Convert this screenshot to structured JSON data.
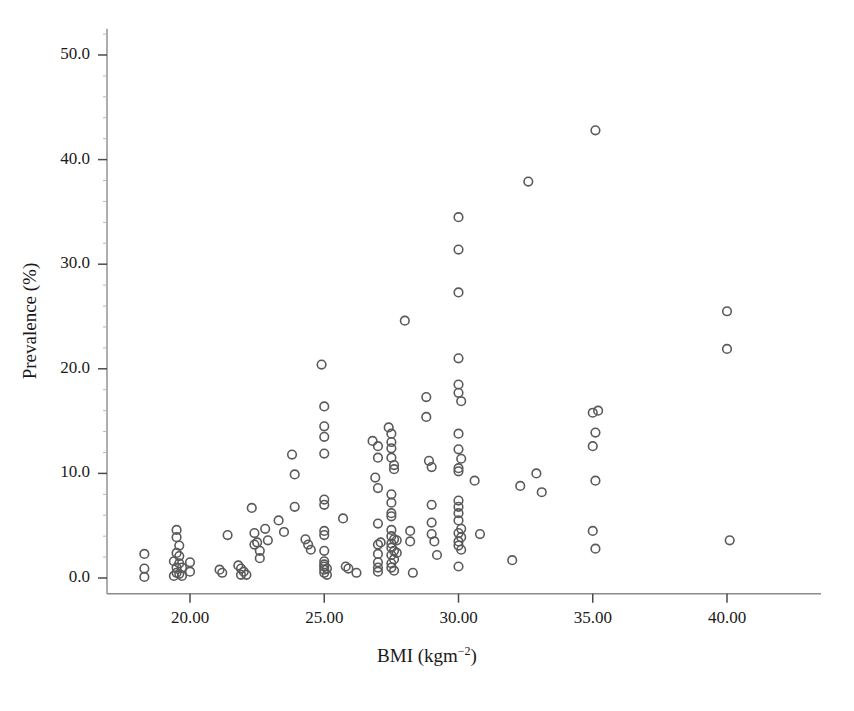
{
  "chart_data": {
    "type": "scatter",
    "title": "",
    "xlabel": "BMI (kgm-2)",
    "xlabel_base": "BMI (kgm",
    "xlabel_sup": "−2",
    "xlabel_tail": ")",
    "ylabel": "Prevalence (%)",
    "xlim": [
      17.2,
      43.5
    ],
    "ylim": [
      -1.5,
      52.5
    ],
    "xticks": [
      20.0,
      25.0,
      30.0,
      35.0,
      40.0
    ],
    "xtick_labels": [
      "20.00",
      "25.00",
      "30.00",
      "35.00",
      "40.00"
    ],
    "yticks": [
      0.0,
      10.0,
      20.0,
      30.0,
      40.0,
      50.0
    ],
    "ytick_labels": [
      "0.0",
      "10.0",
      "20.0",
      "30.0",
      "40.0",
      "50.0"
    ],
    "grid": false,
    "legend": null,
    "marker": "open-circle",
    "marker_color": "#5a5a5a",
    "marker_fill": "none",
    "marker_radius": 4.3,
    "axis_color": "#8a8a8a",
    "points": [
      [
        18.3,
        2.3
      ],
      [
        18.3,
        0.9
      ],
      [
        18.3,
        0.1
      ],
      [
        19.5,
        4.6
      ],
      [
        19.5,
        3.9
      ],
      [
        19.6,
        3.1
      ],
      [
        19.5,
        2.4
      ],
      [
        19.6,
        2.1
      ],
      [
        19.4,
        1.6
      ],
      [
        19.6,
        1.4
      ],
      [
        19.5,
        1.0
      ],
      [
        19.7,
        1.0
      ],
      [
        19.5,
        0.5
      ],
      [
        19.6,
        0.4
      ],
      [
        19.4,
        0.2
      ],
      [
        19.7,
        0.2
      ],
      [
        20.0,
        1.5
      ],
      [
        20.0,
        0.6
      ],
      [
        21.1,
        0.8
      ],
      [
        21.2,
        0.5
      ],
      [
        21.4,
        4.1
      ],
      [
        21.8,
        1.2
      ],
      [
        21.9,
        0.9
      ],
      [
        22.0,
        0.6
      ],
      [
        21.9,
        0.3
      ],
      [
        22.1,
        0.3
      ],
      [
        22.3,
        6.7
      ],
      [
        22.4,
        4.3
      ],
      [
        22.4,
        3.2
      ],
      [
        22.5,
        3.4
      ],
      [
        22.6,
        2.6
      ],
      [
        22.6,
        1.9
      ],
      [
        22.8,
        4.7
      ],
      [
        22.9,
        3.6
      ],
      [
        23.3,
        5.5
      ],
      [
        23.5,
        4.4
      ],
      [
        23.8,
        11.8
      ],
      [
        23.9,
        9.9
      ],
      [
        23.9,
        6.8
      ],
      [
        24.3,
        3.7
      ],
      [
        24.4,
        3.2
      ],
      [
        24.5,
        2.7
      ],
      [
        24.9,
        20.4
      ],
      [
        25.0,
        16.4
      ],
      [
        25.0,
        14.5
      ],
      [
        25.0,
        13.5
      ],
      [
        25.0,
        11.9
      ],
      [
        25.0,
        7.5
      ],
      [
        25.0,
        7.0
      ],
      [
        25.0,
        4.5
      ],
      [
        25.0,
        4.1
      ],
      [
        25.0,
        2.6
      ],
      [
        25.0,
        1.6
      ],
      [
        25.0,
        1.3
      ],
      [
        25.0,
        1.1
      ],
      [
        25.0,
        0.8
      ],
      [
        25.0,
        0.5
      ],
      [
        25.1,
        0.9
      ],
      [
        25.1,
        0.3
      ],
      [
        25.7,
        5.7
      ],
      [
        25.8,
        1.1
      ],
      [
        25.9,
        0.9
      ],
      [
        26.2,
        0.5
      ],
      [
        26.8,
        13.1
      ],
      [
        27.0,
        12.6
      ],
      [
        27.0,
        11.5
      ],
      [
        26.9,
        9.6
      ],
      [
        27.0,
        8.6
      ],
      [
        27.0,
        5.2
      ],
      [
        27.1,
        3.4
      ],
      [
        27.0,
        3.2
      ],
      [
        27.0,
        2.3
      ],
      [
        27.0,
        1.5
      ],
      [
        27.0,
        1.0
      ],
      [
        27.0,
        0.6
      ],
      [
        27.4,
        14.4
      ],
      [
        27.5,
        13.8
      ],
      [
        27.5,
        13.0
      ],
      [
        27.5,
        12.4
      ],
      [
        27.5,
        11.5
      ],
      [
        27.6,
        10.8
      ],
      [
        27.6,
        10.4
      ],
      [
        27.5,
        8.0
      ],
      [
        27.5,
        7.2
      ],
      [
        27.5,
        6.2
      ],
      [
        27.5,
        5.9
      ],
      [
        27.5,
        4.6
      ],
      [
        27.5,
        4.0
      ],
      [
        27.6,
        3.7
      ],
      [
        27.5,
        3.3
      ],
      [
        27.5,
        2.9
      ],
      [
        27.6,
        2.6
      ],
      [
        27.5,
        2.2
      ],
      [
        27.6,
        1.8
      ],
      [
        27.5,
        1.4
      ],
      [
        27.5,
        1.0
      ],
      [
        27.6,
        0.7
      ],
      [
        27.7,
        3.6
      ],
      [
        27.7,
        2.4
      ],
      [
        28.0,
        24.6
      ],
      [
        28.2,
        4.5
      ],
      [
        28.2,
        3.5
      ],
      [
        28.3,
        0.5
      ],
      [
        28.8,
        17.3
      ],
      [
        28.8,
        15.4
      ],
      [
        28.9,
        11.2
      ],
      [
        29.0,
        10.6
      ],
      [
        29.0,
        7.0
      ],
      [
        29.0,
        5.3
      ],
      [
        29.0,
        4.2
      ],
      [
        29.1,
        3.5
      ],
      [
        29.2,
        2.2
      ],
      [
        30.0,
        34.5
      ],
      [
        30.0,
        31.4
      ],
      [
        30.0,
        27.3
      ],
      [
        30.0,
        21.0
      ],
      [
        30.0,
        18.5
      ],
      [
        30.0,
        17.7
      ],
      [
        30.1,
        16.9
      ],
      [
        30.0,
        13.8
      ],
      [
        30.0,
        12.3
      ],
      [
        30.1,
        11.4
      ],
      [
        30.0,
        10.5
      ],
      [
        30.0,
        10.2
      ],
      [
        30.0,
        7.4
      ],
      [
        30.0,
        6.8
      ],
      [
        30.0,
        6.2
      ],
      [
        30.0,
        5.5
      ],
      [
        30.1,
        4.7
      ],
      [
        30.0,
        4.3
      ],
      [
        30.1,
        3.9
      ],
      [
        30.0,
        3.5
      ],
      [
        30.0,
        3.1
      ],
      [
        30.1,
        2.7
      ],
      [
        30.0,
        1.1
      ],
      [
        30.6,
        9.3
      ],
      [
        30.8,
        4.2
      ],
      [
        32.0,
        1.7
      ],
      [
        32.3,
        8.8
      ],
      [
        32.6,
        37.9
      ],
      [
        32.9,
        10.0
      ],
      [
        33.1,
        8.2
      ],
      [
        35.0,
        15.8
      ],
      [
        35.2,
        16.0
      ],
      [
        35.1,
        13.9
      ],
      [
        35.0,
        12.6
      ],
      [
        35.1,
        42.8
      ],
      [
        35.1,
        9.3
      ],
      [
        35.0,
        4.5
      ],
      [
        35.1,
        2.8
      ],
      [
        40.0,
        25.5
      ],
      [
        40.0,
        21.9
      ],
      [
        40.1,
        3.6
      ]
    ]
  }
}
